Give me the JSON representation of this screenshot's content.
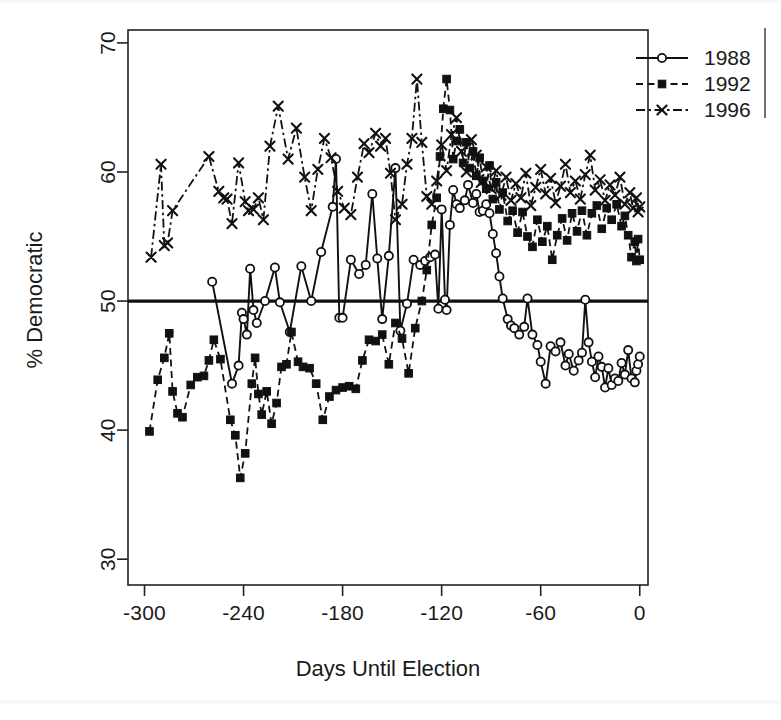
{
  "chart_data": {
    "type": "line",
    "title": "",
    "xlabel": "Days Until Election",
    "ylabel": "% Democratic",
    "xlim": [
      -310,
      5
    ],
    "ylim": [
      28,
      71
    ],
    "xticks": [
      -300,
      -240,
      -180,
      -120,
      -60,
      0
    ],
    "xtick_labels": [
      "-300",
      "-240",
      "-180",
      "-120",
      "-60",
      "0"
    ],
    "yticks": [
      30,
      40,
      50,
      60,
      70
    ],
    "ytick_labels": [
      "30",
      "40",
      "50",
      "60",
      "70"
    ],
    "grid": false,
    "legend_position": "top-right",
    "reference_line": {
      "y": 50,
      "label": "50% line",
      "style": "solid-thick"
    },
    "series": [
      {
        "name": "1988",
        "marker": "open-circle",
        "linestyle": "solid",
        "color": "#111111",
        "points": [
          [
            -259,
            51.5
          ],
          [
            -247,
            43.6
          ],
          [
            -243,
            45.0
          ],
          [
            -241,
            49.1
          ],
          [
            -240,
            48.6
          ],
          [
            -238,
            47.4
          ],
          [
            -236,
            52.5
          ],
          [
            -234,
            49.3
          ],
          [
            -232,
            48.3
          ],
          [
            -227,
            50.0
          ],
          [
            -221,
            52.6
          ],
          [
            -218,
            49.9
          ],
          [
            -212,
            47.6
          ],
          [
            -205,
            52.7
          ],
          [
            -199,
            50.0
          ],
          [
            -193,
            53.8
          ],
          [
            -186,
            57.3
          ],
          [
            -184,
            61.0
          ],
          [
            -182,
            48.7
          ],
          [
            -180,
            48.7
          ],
          [
            -175,
            53.2
          ],
          [
            -170,
            52.1
          ],
          [
            -166,
            52.8
          ],
          [
            -162,
            58.3
          ],
          [
            -159,
            53.3
          ],
          [
            -156,
            48.6
          ],
          [
            -152,
            53.5
          ],
          [
            -148,
            60.3
          ],
          [
            -145,
            47.7
          ],
          [
            -141,
            49.8
          ],
          [
            -137,
            53.2
          ],
          [
            -133,
            52.8
          ],
          [
            -130,
            53.1
          ],
          [
            -127,
            53.4
          ],
          [
            -124,
            53.6
          ],
          [
            -122,
            49.4
          ],
          [
            -120,
            57.1
          ],
          [
            -118,
            50.1
          ],
          [
            -117,
            49.3
          ],
          [
            -115,
            55.9
          ],
          [
            -113,
            58.6
          ],
          [
            -111,
            57.5
          ],
          [
            -109,
            57.2
          ],
          [
            -106,
            57.8
          ],
          [
            -104,
            59.0
          ],
          [
            -101,
            57.6
          ],
          [
            -99,
            58.3
          ],
          [
            -97,
            56.9
          ],
          [
            -95,
            57.0
          ],
          [
            -93,
            57.5
          ],
          [
            -91,
            56.8
          ],
          [
            -89,
            55.2
          ],
          [
            -87,
            53.7
          ],
          [
            -85,
            51.9
          ],
          [
            -83,
            50.2
          ],
          [
            -80,
            48.6
          ],
          [
            -78,
            48.1
          ],
          [
            -76,
            47.9
          ],
          [
            -73,
            47.4
          ],
          [
            -70,
            48.0
          ],
          [
            -68,
            50.2
          ],
          [
            -65,
            47.4
          ],
          [
            -62,
            46.6
          ],
          [
            -60,
            45.3
          ],
          [
            -57,
            43.6
          ],
          [
            -54,
            46.5
          ],
          [
            -51,
            46.1
          ],
          [
            -48,
            46.8
          ],
          [
            -45,
            45.0
          ],
          [
            -43,
            45.9
          ],
          [
            -40,
            44.6
          ],
          [
            -37,
            45.4
          ],
          [
            -35,
            46.0
          ],
          [
            -33,
            50.1
          ],
          [
            -31,
            46.8
          ],
          [
            -29,
            45.3
          ],
          [
            -27,
            44.1
          ],
          [
            -25,
            45.7
          ],
          [
            -23,
            44.9
          ],
          [
            -21,
            43.3
          ],
          [
            -19,
            44.8
          ],
          [
            -17,
            43.5
          ],
          [
            -15,
            44.0
          ],
          [
            -13,
            43.8
          ],
          [
            -11,
            45.2
          ],
          [
            -9,
            44.3
          ],
          [
            -7,
            46.2
          ],
          [
            -5,
            44.0
          ],
          [
            -3,
            43.7
          ],
          [
            -2,
            44.6
          ],
          [
            -1,
            45.1
          ],
          [
            0,
            45.7
          ]
        ]
      },
      {
        "name": "1992",
        "marker": "filled-square",
        "linestyle": "dashed",
        "color": "#111111",
        "points": [
          [
            -297,
            39.9
          ],
          [
            -292,
            43.9
          ],
          [
            -288,
            45.6
          ],
          [
            -285,
            47.5
          ],
          [
            -283,
            43.0
          ],
          [
            -280,
            41.3
          ],
          [
            -277,
            41.0
          ],
          [
            -272,
            43.5
          ],
          [
            -268,
            44.1
          ],
          [
            -264,
            44.2
          ],
          [
            -261,
            45.4
          ],
          [
            -258,
            47.0
          ],
          [
            -254,
            45.5
          ],
          [
            -248,
            40.8
          ],
          [
            -245,
            39.6
          ],
          [
            -242,
            36.3
          ],
          [
            -239,
            38.2
          ],
          [
            -235,
            43.6
          ],
          [
            -233,
            45.6
          ],
          [
            -231,
            42.8
          ],
          [
            -229,
            41.2
          ],
          [
            -226,
            43.0
          ],
          [
            -223,
            40.5
          ],
          [
            -220,
            42.1
          ],
          [
            -217,
            44.9
          ],
          [
            -214,
            45.1
          ],
          [
            -211,
            47.6
          ],
          [
            -207,
            45.3
          ],
          [
            -204,
            44.9
          ],
          [
            -200,
            44.8
          ],
          [
            -196,
            43.6
          ],
          [
            -192,
            40.8
          ],
          [
            -188,
            42.6
          ],
          [
            -184,
            43.1
          ],
          [
            -180,
            43.3
          ],
          [
            -176,
            43.4
          ],
          [
            -172,
            43.2
          ],
          [
            -168,
            45.4
          ],
          [
            -164,
            47.0
          ],
          [
            -160,
            46.9
          ],
          [
            -156,
            47.4
          ],
          [
            -152,
            45.1
          ],
          [
            -148,
            48.3
          ],
          [
            -144,
            47.1
          ],
          [
            -140,
            44.4
          ],
          [
            -136,
            47.9
          ],
          [
            -132,
            50.0
          ],
          [
            -129,
            52.4
          ],
          [
            -126,
            55.9
          ],
          [
            -123,
            58.0
          ],
          [
            -121,
            61.2
          ],
          [
            -119,
            64.9
          ],
          [
            -117,
            67.2
          ],
          [
            -115,
            64.8
          ],
          [
            -113,
            61.0
          ],
          [
            -111,
            62.4
          ],
          [
            -109,
            63.3
          ],
          [
            -107,
            60.7
          ],
          [
            -105,
            62.3
          ],
          [
            -103,
            60.3
          ],
          [
            -101,
            61.6
          ],
          [
            -99,
            59.7
          ],
          [
            -97,
            61.1
          ],
          [
            -95,
            59.3
          ],
          [
            -93,
            58.7
          ],
          [
            -91,
            60.5
          ],
          [
            -89,
            57.9
          ],
          [
            -87,
            59.2
          ],
          [
            -85,
            57.1
          ],
          [
            -83,
            58.4
          ],
          [
            -80,
            56.2
          ],
          [
            -77,
            57.0
          ],
          [
            -74,
            55.3
          ],
          [
            -71,
            56.9
          ],
          [
            -68,
            55.0
          ],
          [
            -65,
            54.2
          ],
          [
            -62,
            56.3
          ],
          [
            -59,
            54.6
          ],
          [
            -56,
            55.8
          ],
          [
            -53,
            53.2
          ],
          [
            -50,
            55.1
          ],
          [
            -47,
            56.4
          ],
          [
            -44,
            54.7
          ],
          [
            -41,
            56.8
          ],
          [
            -38,
            55.4
          ],
          [
            -35,
            57.0
          ],
          [
            -32,
            55.1
          ],
          [
            -29,
            56.8
          ],
          [
            -26,
            57.4
          ],
          [
            -23,
            55.6
          ],
          [
            -20,
            57.2
          ],
          [
            -17,
            56.3
          ],
          [
            -14,
            57.5
          ],
          [
            -11,
            55.8
          ],
          [
            -9,
            56.6
          ],
          [
            -7,
            55.1
          ],
          [
            -5,
            53.4
          ],
          [
            -3,
            54.6
          ],
          [
            -2,
            53.1
          ],
          [
            -1,
            54.8
          ],
          [
            0,
            53.2
          ]
        ]
      },
      {
        "name": "1996",
        "marker": "x-cross",
        "linestyle": "dash-dot",
        "color": "#111111",
        "points": [
          [
            -296,
            53.4
          ],
          [
            -290,
            60.6
          ],
          [
            -288,
            54.3
          ],
          [
            -286,
            54.5
          ],
          [
            -283,
            57.0
          ],
          [
            -261,
            61.2
          ],
          [
            -255,
            58.5
          ],
          [
            -252,
            58.0
          ],
          [
            -250,
            57.9
          ],
          [
            -247,
            56.0
          ],
          [
            -243,
            60.7
          ],
          [
            -239,
            57.7
          ],
          [
            -237,
            57.0
          ],
          [
            -234,
            57.1
          ],
          [
            -231,
            58.0
          ],
          [
            -228,
            56.3
          ],
          [
            -224,
            62.0
          ],
          [
            -219,
            65.1
          ],
          [
            -213,
            61.0
          ],
          [
            -208,
            63.4
          ],
          [
            -203,
            59.6
          ],
          [
            -199,
            57.0
          ],
          [
            -195,
            60.2
          ],
          [
            -191,
            62.6
          ],
          [
            -187,
            61.1
          ],
          [
            -183,
            58.5
          ],
          [
            -179,
            57.2
          ],
          [
            -175,
            56.7
          ],
          [
            -171,
            59.6
          ],
          [
            -167,
            62.2
          ],
          [
            -164,
            61.5
          ],
          [
            -160,
            63.0
          ],
          [
            -157,
            62.0
          ],
          [
            -154,
            62.6
          ],
          [
            -151,
            59.9
          ],
          [
            -148,
            56.3
          ],
          [
            -144,
            57.5
          ],
          [
            -141,
            60.6
          ],
          [
            -138,
            62.6
          ],
          [
            -135,
            67.2
          ],
          [
            -132,
            62.3
          ],
          [
            -129,
            58.1
          ],
          [
            -126,
            57.5
          ],
          [
            -123,
            59.3
          ],
          [
            -120,
            62.1
          ],
          [
            -117,
            60.1
          ],
          [
            -114,
            62.9
          ],
          [
            -111,
            64.2
          ],
          [
            -108,
            61.6
          ],
          [
            -105,
            60.0
          ],
          [
            -102,
            62.5
          ],
          [
            -99,
            61.3
          ],
          [
            -96,
            59.2
          ],
          [
            -93,
            60.4
          ],
          [
            -90,
            58.7
          ],
          [
            -87,
            60.1
          ],
          [
            -84,
            58.2
          ],
          [
            -81,
            59.6
          ],
          [
            -78,
            57.8
          ],
          [
            -75,
            59.1
          ],
          [
            -72,
            58.0
          ],
          [
            -69,
            59.9
          ],
          [
            -66,
            57.4
          ],
          [
            -63,
            58.8
          ],
          [
            -60,
            60.2
          ],
          [
            -57,
            58.3
          ],
          [
            -54,
            59.5
          ],
          [
            -51,
            57.6
          ],
          [
            -48,
            58.9
          ],
          [
            -45,
            60.6
          ],
          [
            -42,
            58.4
          ],
          [
            -39,
            59.3
          ],
          [
            -36,
            57.9
          ],
          [
            -33,
            59.8
          ],
          [
            -30,
            61.3
          ],
          [
            -27,
            58.6
          ],
          [
            -24,
            59.4
          ],
          [
            -21,
            57.8
          ],
          [
            -18,
            59.0
          ],
          [
            -15,
            58.2
          ],
          [
            -12,
            59.6
          ],
          [
            -9,
            57.5
          ],
          [
            -6,
            58.4
          ],
          [
            -4,
            57.2
          ],
          [
            -2,
            58.0
          ],
          [
            -1,
            56.9
          ],
          [
            0,
            57.3
          ]
        ]
      }
    ],
    "legend": [
      {
        "name": "1988",
        "marker": "open-circle",
        "linestyle": "solid"
      },
      {
        "name": "1992",
        "marker": "filled-square",
        "linestyle": "dashed"
      },
      {
        "name": "1996",
        "marker": "x-cross",
        "linestyle": "dash-dot"
      }
    ]
  }
}
